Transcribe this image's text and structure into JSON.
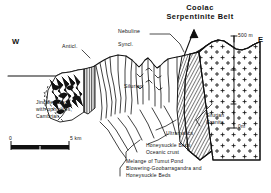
{
  "figure": {
    "kind": "geological-cross-section",
    "title_line1": "Coolac",
    "title_line2": "Serpentinite Belt"
  },
  "compass": {
    "west": "W",
    "east": "E"
  },
  "structures": [
    {
      "id": "anticline",
      "label": "Anticl."
    },
    {
      "id": "syncline",
      "label": "Syncl."
    },
    {
      "id": "nebuline",
      "label": "Nebuline"
    },
    {
      "id": "silurian",
      "label": "Silurian"
    }
  ],
  "legend_left": {
    "lines": [
      "Jindalee Beds",
      "with ophiolites,",
      "Cambrian"
    ]
  },
  "legend_right": {
    "granite": [
      "Silurian",
      "Granite"
    ],
    "ultramafics": "Ultramafics",
    "honeysuckle": [
      "Honeysuckle Beds",
      "Oceanic crust"
    ],
    "melange": [
      "Melange of Tumut Pond",
      "Blowering-Goobarragandra and",
      "Honeysuckle Beds"
    ]
  },
  "scales": {
    "vertical_top": "500 m",
    "vertical_bottom": "0m",
    "horizontal_start": "0",
    "horizontal_end": "5 km"
  },
  "colors": {
    "ink": "#111111",
    "paper": "#ffffff",
    "serpentinite_fill": "#4a4a4a",
    "jindalee_fill": "#222222"
  }
}
